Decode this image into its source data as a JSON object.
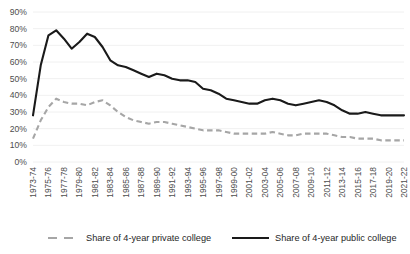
{
  "chart_data": {
    "type": "line",
    "title": "",
    "subtitle": "",
    "xlabel": "",
    "ylabel": "",
    "ylim": [
      0,
      90
    ],
    "ytick_values": [
      0,
      10,
      20,
      30,
      40,
      50,
      60,
      70,
      80,
      90
    ],
    "ytick_labels": [
      "0%",
      "10%",
      "20%",
      "30%",
      "40%",
      "50%",
      "60%",
      "70%",
      "80%",
      "90%"
    ],
    "grid": true,
    "legend_position": "bottom",
    "categories": [
      "1973-74",
      "1974-75",
      "1975-76",
      "1976-77",
      "1977-78",
      "1978-79",
      "1979-80",
      "1980-81",
      "1981-82",
      "1982-83",
      "1983-84",
      "1984-85",
      "1985-86",
      "1986-87",
      "1987-88",
      "1988-89",
      "1989-90",
      "1990-91",
      "1991-92",
      "1992-93",
      "1993-94",
      "1994-95",
      "1995-96",
      "1996-97",
      "1997-98",
      "1998-99",
      "1999-00",
      "2000-01",
      "2001-02",
      "2002-03",
      "2003-04",
      "2004-05",
      "2005-06",
      "2006-07",
      "2007-08",
      "2008-09",
      "2009-10",
      "2010-11",
      "2011-12",
      "2012-13",
      "2013-14",
      "2014-15",
      "2015-16",
      "2016-17",
      "2017-18",
      "2018-19",
      "2019-20",
      "2020-21",
      "2021-22"
    ],
    "xtick_labels": [
      "1973-74",
      "1975-76",
      "1977-78",
      "1979-80",
      "1981-82",
      "1983-84",
      "1985-86",
      "1987-88",
      "1989-90",
      "1991-92",
      "1993-94",
      "1995-96",
      "1997-98",
      "1999-00",
      "2001-02",
      "2003-04",
      "2005-06",
      "2007-08",
      "2009-10",
      "2011-12",
      "2013-14",
      "2015-16",
      "2017-18",
      "2019-20",
      "2021-22"
    ],
    "xtick_indices": [
      0,
      2,
      4,
      6,
      8,
      10,
      12,
      14,
      16,
      18,
      20,
      22,
      24,
      26,
      28,
      30,
      32,
      34,
      36,
      38,
      40,
      42,
      44,
      46,
      48
    ],
    "series": [
      {
        "name": "Share of 4-year private college",
        "style": "dashed",
        "color": "#a6a6a6",
        "values": [
          14,
          25,
          33,
          38,
          36,
          35,
          35,
          34,
          36,
          37,
          34,
          30,
          27,
          25,
          24,
          23,
          24,
          24,
          23,
          22,
          21,
          20,
          19,
          19,
          19,
          18,
          17,
          17,
          17,
          17,
          17,
          18,
          17,
          16,
          16,
          17,
          17,
          17,
          17,
          16,
          15,
          15,
          14,
          14,
          14,
          13,
          13,
          13,
          13
        ]
      },
      {
        "name": "Share of 4-year public college",
        "style": "solid",
        "color": "#1a1a1a",
        "values": [
          28,
          58,
          76,
          79,
          74,
          68,
          72,
          77,
          75,
          69,
          61,
          58,
          57,
          55,
          53,
          51,
          53,
          52,
          50,
          49,
          49,
          48,
          44,
          43,
          41,
          38,
          37,
          36,
          35,
          35,
          37,
          38,
          37,
          35,
          34,
          35,
          36,
          37,
          36,
          34,
          31,
          29,
          29,
          30,
          29,
          28,
          28,
          28,
          28
        ]
      }
    ]
  },
  "legend": {
    "items": [
      {
        "label": "Share of 4-year private college",
        "style": "dashed",
        "color": "#a6a6a6"
      },
      {
        "label": "Share of 4-year public college",
        "style": "solid",
        "color": "#1a1a1a"
      }
    ]
  }
}
